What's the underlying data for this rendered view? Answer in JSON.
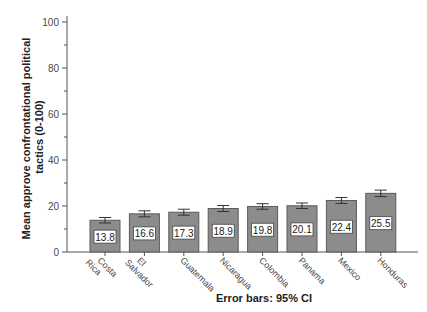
{
  "chart_data": {
    "type": "bar",
    "title": "",
    "xlabel": "Error bars: 95% CI",
    "ylabel_lines": [
      "Mean approve confrontational political",
      "tactics (0-100)"
    ],
    "ylabel": "Mean approve confrontational political tactics (0-100)",
    "categories": [
      "Costa Rica",
      "El Salvador",
      "Guatemala",
      "Nicaragua",
      "Colombia",
      "Panama",
      "Mexico",
      "Honduras"
    ],
    "category_label_lines": [
      [
        "Costa",
        "Rica"
      ],
      [
        "El",
        "Salvador"
      ],
      [
        "Guatemala"
      ],
      [
        "Nicaragua"
      ],
      [
        "Colombia"
      ],
      [
        "Panama"
      ],
      [
        "Mexico"
      ],
      [
        "Honduras"
      ]
    ],
    "values": [
      13.8,
      16.6,
      17.3,
      18.9,
      19.8,
      20.1,
      22.4,
      25.5
    ],
    "value_labels": [
      "13.8",
      "16.6",
      "17.3",
      "18.9",
      "19.8",
      "20.1",
      "22.4",
      "25.5"
    ],
    "error_bars": [
      1.2,
      1.3,
      1.3,
      1.3,
      1.2,
      1.2,
      1.3,
      1.4
    ],
    "error_bar_type": "95% CI",
    "ylim": [
      0,
      100
    ],
    "yticks": [
      0,
      20,
      40,
      60,
      80,
      100
    ],
    "yticks_minor": [
      10,
      30,
      50,
      70,
      90
    ],
    "grid": false,
    "legend": null,
    "colors": {
      "bar_fill": "#8c8c8c",
      "bar_stroke": "#5a5a5a",
      "axis": "#555555",
      "label_box": "#ffffff"
    }
  }
}
